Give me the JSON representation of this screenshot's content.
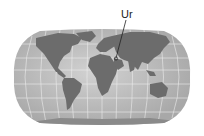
{
  "map": {
    "projection": "robinson-style world map",
    "colors": {
      "ocean": "#b4b4b4",
      "ocean_light": "#cfcfcf",
      "land": "#6e6e6e",
      "graticule": "#e8e8e8",
      "marker": "#222222"
    },
    "annotation": {
      "label": "Ur",
      "marker": "location-marker"
    }
  }
}
